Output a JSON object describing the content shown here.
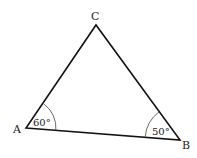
{
  "diagram": {
    "type": "triangle",
    "vertices": [
      {
        "label": "A",
        "x": 26,
        "y": 128
      },
      {
        "label": "B",
        "x": 180,
        "y": 140
      },
      {
        "label": "C",
        "x": 96,
        "y": 25
      }
    ],
    "angles": [
      {
        "vertex": "A",
        "value": "60°"
      },
      {
        "vertex": "B",
        "value": "50°"
      }
    ],
    "line_color": "#111111"
  }
}
